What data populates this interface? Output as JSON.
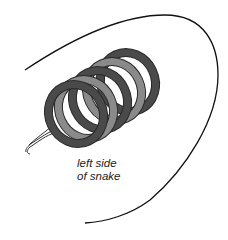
{
  "diagram": {
    "label_line1": "left side",
    "label_line2": "of snake",
    "colors": {
      "outline": "#111111",
      "ring_dark": "#4a4a4a",
      "ring_light": "#8a8a8a",
      "ring_edge": "#2a2a2a",
      "wire": "#ffffff",
      "wire_edge": "#333333"
    },
    "rings": [
      {
        "cx": 72,
        "cy": 115,
        "tone": "dark"
      },
      {
        "cx": 82,
        "cy": 110,
        "tone": "light"
      },
      {
        "cx": 95,
        "cy": 102,
        "tone": "dark"
      },
      {
        "cx": 108,
        "cy": 94,
        "tone": "light"
      },
      {
        "cx": 122,
        "cy": 85,
        "tone": "dark"
      }
    ]
  }
}
